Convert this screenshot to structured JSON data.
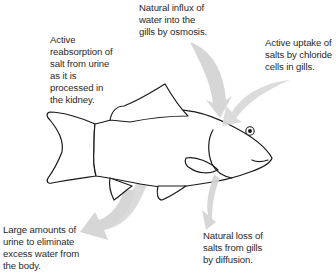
{
  "diagram": {
    "labels": {
      "top": "Natural influx of\nwater into the\ngills by osmosis.",
      "upper_left": "Active\nreabsorption of\nsalt from urine\nas it is\nprocessed in\nthe kidney.",
      "right": "Active uptake of\nsalts by chloride\ncells in gills.",
      "bottom_left": "Large amounts of\nurine to eliminate\nexcess water from\nthe body.",
      "bottom_right": "Natural loss of\nsalts from gills\nby diffusion."
    },
    "arrows": [
      {
        "id": "water-influx",
        "direction": "into gills from top"
      },
      {
        "id": "salt-uptake",
        "direction": "into gills from upper right"
      },
      {
        "id": "salt-reabsorption",
        "direction": "curved, inside body toward kidney"
      },
      {
        "id": "urine-output",
        "direction": "out of body, lower left"
      },
      {
        "id": "salt-loss",
        "direction": "out of gills, downward"
      }
    ],
    "colors": {
      "arrow_fill": "#d4d4d4",
      "outline": "#1a1a1a",
      "text": "#2a2a2a",
      "background": "#ffffff"
    }
  }
}
